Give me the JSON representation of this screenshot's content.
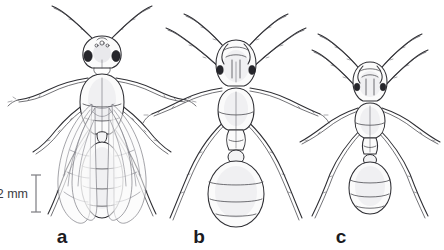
{
  "figure": {
    "type": "scientific-illustration",
    "background_color": "#ffffff",
    "ink_color": "#2e2e33",
    "width": 444,
    "height": 250
  },
  "scale_bar": {
    "label": "2 mm",
    "value": 2,
    "unit": "mm",
    "orientation": "vertical",
    "color": "#808086"
  },
  "panels": [
    {
      "label": "a",
      "caste": "winged queen",
      "has_wings": true,
      "wing_count": 4,
      "gaster_segments": 4,
      "relative_size": "largest"
    },
    {
      "label": "b",
      "caste": "major worker",
      "has_wings": false,
      "wing_count": 0,
      "gaster_segments": 4,
      "relative_size": "medium"
    },
    {
      "label": "c",
      "caste": "minor worker",
      "has_wings": false,
      "wing_count": 0,
      "gaster_segments": 3,
      "relative_size": "smallest"
    }
  ]
}
